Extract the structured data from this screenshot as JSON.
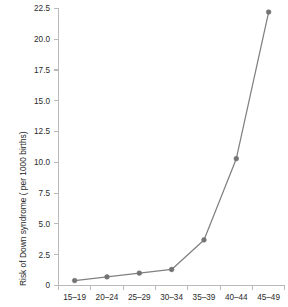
{
  "chart_data": {
    "type": "line",
    "title": "",
    "xlabel": "",
    "ylabel": "Risk of Down syndrome ( per 1000 births)",
    "categories": [
      "15–19",
      "20–24",
      "25–29",
      "30–34",
      "35–39",
      "40–44",
      "45–49"
    ],
    "values": [
      0.4,
      0.7,
      1.0,
      1.3,
      3.7,
      10.3,
      22.2
    ],
    "ylim": [
      0,
      22.5
    ],
    "yticks": [
      0,
      2.5,
      5.0,
      7.5,
      10.0,
      12.5,
      15.0,
      17.5,
      20.0,
      22.5
    ],
    "ytick_labels": [
      "0",
      "2.5",
      "5.0",
      "7.5",
      "10.0",
      "12.5",
      "15.0",
      "17.5",
      "20.0",
      "22.5"
    ],
    "grid": false,
    "legend": null,
    "legend_position": "none",
    "series_color": "#808080",
    "marker_color": "#737373",
    "axis_color": "#b9b9b9",
    "background_color": "#ffffff",
    "marker": "circle"
  }
}
